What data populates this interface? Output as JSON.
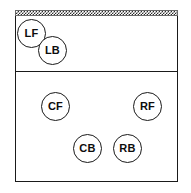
{
  "diagram": {
    "court": {
      "net_label": "net",
      "attack_line_label": "attack line",
      "boundary_label": "court boundary"
    },
    "players": [
      {
        "code": "LF",
        "name": "left front",
        "zone": "front row"
      },
      {
        "code": "LB",
        "name": "left back",
        "zone": "front row"
      },
      {
        "code": "CF",
        "name": "center front",
        "zone": "back row"
      },
      {
        "code": "RF",
        "name": "right front",
        "zone": "back row"
      },
      {
        "code": "CB",
        "name": "center back",
        "zone": "back row"
      },
      {
        "code": "RB",
        "name": "right back",
        "zone": "back row"
      }
    ],
    "colors": {
      "line": "#1a1a1a",
      "net": "#2b2b2b",
      "text": "#0d0d0d",
      "background": "#ffffff"
    }
  }
}
